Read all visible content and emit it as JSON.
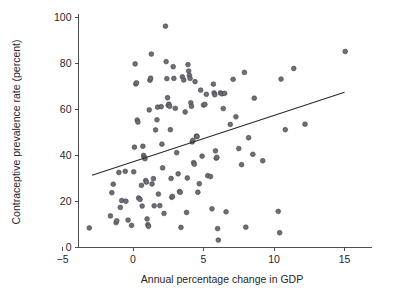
{
  "chart_data": {
    "type": "scatter",
    "title": "",
    "subtitle": "",
    "xlabel": "Annual percentage change in GDP",
    "ylabel": "Contraceptive prevalence rate (percent)",
    "xlim": [
      -6.5,
      17.5
    ],
    "ylim": [
      0,
      100
    ],
    "xticks": [
      -5,
      0,
      5,
      10,
      15
    ],
    "xtick_labels": [
      "−5",
      "0",
      "5",
      "10",
      "15"
    ],
    "yticks": [
      0,
      20,
      40,
      60,
      80,
      100
    ],
    "ytick_labels": [
      "0",
      "20",
      "40",
      "60",
      "80",
      "100"
    ],
    "grid": false,
    "legend": null,
    "legend_position": "none",
    "marker": {
      "shape": "circle",
      "radius": 2.4,
      "fill": "#6e6e76",
      "stroke": "#3c3c44"
    },
    "series": [
      {
        "name": "Countries",
        "type": "scatter",
        "points": [
          [
            -3.1,
            8.3
          ],
          [
            -1.6,
            13.5
          ],
          [
            -1.5,
            23.6
          ],
          [
            -1.4,
            27.3
          ],
          [
            -1.2,
            10.6
          ],
          [
            -1.15,
            11.4
          ],
          [
            -1.0,
            32.4
          ],
          [
            -0.9,
            17.2
          ],
          [
            -0.8,
            20.2
          ],
          [
            -0.55,
            32.9
          ],
          [
            -0.5,
            19.9
          ],
          [
            -0.35,
            11.7
          ],
          [
            -0.1,
            9.4
          ],
          [
            0.05,
            32.7
          ],
          [
            0.1,
            43.4
          ],
          [
            0.15,
            79.6
          ],
          [
            0.2,
            70.9
          ],
          [
            0.25,
            71.4
          ],
          [
            0.3,
            55.2
          ],
          [
            0.35,
            54.3
          ],
          [
            0.4,
            21.3
          ],
          [
            0.5,
            20.7
          ],
          [
            0.6,
            26.8
          ],
          [
            0.65,
            17.8
          ],
          [
            0.7,
            43.8
          ],
          [
            0.75,
            39.8
          ],
          [
            0.8,
            39.0
          ],
          [
            0.85,
            38.4
          ],
          [
            0.9,
            28.9
          ],
          [
            0.95,
            28.2
          ],
          [
            1.0,
            12.2
          ],
          [
            1.05,
            9.7
          ],
          [
            1.1,
            9.0
          ],
          [
            1.15,
            59.6
          ],
          [
            1.2,
            72.5
          ],
          [
            1.25,
            73.4
          ],
          [
            1.3,
            83.9
          ],
          [
            1.35,
            27.4
          ],
          [
            1.45,
            29.7
          ],
          [
            1.5,
            17.9
          ],
          [
            1.6,
            50.9
          ],
          [
            1.7,
            55.3
          ],
          [
            1.75,
            60.8
          ],
          [
            1.8,
            23.0
          ],
          [
            1.9,
            18.0
          ],
          [
            2.0,
            61.0
          ],
          [
            2.05,
            44.7
          ],
          [
            2.1,
            34.4
          ],
          [
            2.2,
            14.6
          ],
          [
            2.3,
            96.0
          ],
          [
            2.35,
            80.6
          ],
          [
            2.4,
            73.2
          ],
          [
            2.45,
            64.9
          ],
          [
            2.5,
            61.6
          ],
          [
            2.55,
            62.1
          ],
          [
            2.6,
            61.2
          ],
          [
            2.65,
            51.0
          ],
          [
            2.7,
            29.8
          ],
          [
            2.75,
            21.6
          ],
          [
            2.8,
            22.0
          ],
          [
            2.85,
            78.4
          ],
          [
            2.9,
            73.3
          ],
          [
            3.0,
            60.3
          ],
          [
            3.1,
            41.0
          ],
          [
            3.2,
            31.8
          ],
          [
            3.3,
            24.1
          ],
          [
            3.35,
            23.8
          ],
          [
            3.4,
            8.5
          ],
          [
            3.5,
            74.0
          ],
          [
            3.6,
            72.6
          ],
          [
            3.7,
            58.7
          ],
          [
            3.8,
            15.0
          ],
          [
            3.85,
            30.0
          ],
          [
            3.9,
            79.3
          ],
          [
            3.95,
            76.5
          ],
          [
            4.0,
            74.6
          ],
          [
            4.05,
            73.3
          ],
          [
            4.1,
            62.7
          ],
          [
            4.15,
            61.2
          ],
          [
            4.2,
            45.7
          ],
          [
            4.25,
            46.4
          ],
          [
            4.3,
            36.7
          ],
          [
            4.35,
            36.0
          ],
          [
            4.4,
            71.9
          ],
          [
            4.5,
            48.2
          ],
          [
            4.55,
            48.0
          ],
          [
            4.6,
            23.8
          ],
          [
            4.7,
            27.5
          ],
          [
            4.8,
            68.2
          ],
          [
            4.9,
            39.5
          ],
          [
            5.0,
            61.7
          ],
          [
            5.1,
            62.0
          ],
          [
            5.2,
            66.4
          ],
          [
            5.3,
            31.0
          ],
          [
            5.5,
            30.6
          ],
          [
            5.6,
            16.6
          ],
          [
            5.7,
            70.8
          ],
          [
            5.75,
            67.0
          ],
          [
            5.8,
            66.2
          ],
          [
            5.85,
            41.8
          ],
          [
            5.9,
            38.6
          ],
          [
            5.95,
            39.0
          ],
          [
            6.0,
            8.0
          ],
          [
            6.05,
            3.0
          ],
          [
            6.2,
            67.0
          ],
          [
            6.3,
            66.6
          ],
          [
            6.4,
            60.2
          ],
          [
            6.5,
            66.8
          ],
          [
            6.6,
            15.3
          ],
          [
            6.9,
            53.3
          ],
          [
            7.1,
            72.9
          ],
          [
            7.3,
            56.6
          ],
          [
            7.5,
            42.8
          ],
          [
            7.7,
            35.8
          ],
          [
            7.9,
            75.9
          ],
          [
            8.0,
            8.6
          ],
          [
            8.2,
            47.5
          ],
          [
            8.5,
            40.3
          ],
          [
            8.6,
            64.7
          ],
          [
            9.2,
            37.5
          ],
          [
            10.3,
            15.5
          ],
          [
            10.4,
            6.2
          ],
          [
            10.5,
            73.0
          ],
          [
            10.8,
            51.0
          ],
          [
            11.4,
            77.6
          ],
          [
            12.2,
            53.4
          ],
          [
            15.05,
            85.0
          ]
        ]
      },
      {
        "name": "Linear fit",
        "type": "line",
        "points": [
          [
            -2.9,
            31.2
          ],
          [
            15.0,
            67.3
          ]
        ]
      }
    ]
  }
}
